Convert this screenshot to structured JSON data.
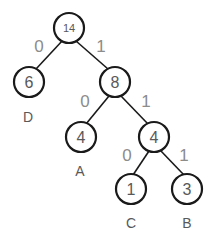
{
  "diagram": {
    "type": "huffman-tree",
    "nodes": [
      {
        "id": "root",
        "value": "14"
      },
      {
        "id": "n6",
        "value": "6",
        "symbol": "D"
      },
      {
        "id": "n8",
        "value": "8"
      },
      {
        "id": "n4a",
        "value": "4",
        "symbol": "A"
      },
      {
        "id": "n4",
        "value": "4"
      },
      {
        "id": "n1",
        "value": "1",
        "symbol": "C"
      },
      {
        "id": "n3",
        "value": "3",
        "symbol": "B"
      }
    ],
    "edges": [
      {
        "from": "root",
        "to": "n6",
        "label": "0"
      },
      {
        "from": "root",
        "to": "n8",
        "label": "1"
      },
      {
        "from": "n8",
        "to": "n4a",
        "label": "0"
      },
      {
        "from": "n8",
        "to": "n4",
        "label": "1"
      },
      {
        "from": "n4",
        "to": "n1",
        "label": "0"
      },
      {
        "from": "n4",
        "to": "n3",
        "label": "1"
      }
    ]
  }
}
